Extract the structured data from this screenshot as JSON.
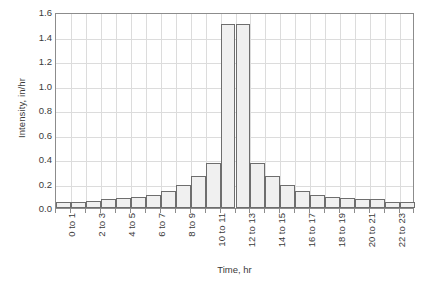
{
  "chart_data": {
    "type": "bar",
    "title": "",
    "xlabel": "Time, hr",
    "ylabel": "Intensity, in/hr",
    "ylim": [
      0.0,
      1.6
    ],
    "ytick_labels": [
      "1.6",
      "1.4",
      "1.2",
      "1.0",
      "0.8",
      "0.6",
      "0.4",
      "0.2",
      "0.0"
    ],
    "ytick_values": [
      1.6,
      1.4,
      1.2,
      1.0,
      0.8,
      0.6,
      0.4,
      0.2,
      0.0
    ],
    "ytick_step": 0.2,
    "grid": "both",
    "legend": "none",
    "categories": [
      "0 to 1",
      "1 to 2",
      "2 to 3",
      "3 to 4",
      "4 to 5",
      "5 to 6",
      "6 to 7",
      "7 to 8",
      "8 to 9",
      "9 to 10",
      "10 to 11",
      "11 to 12",
      "12 to 13",
      "13 to 14",
      "14 to 15",
      "15 to 16",
      "16 to 17",
      "17 to 18",
      "18 to 19",
      "19 to 20",
      "20 to 21",
      "21 to 22",
      "22 to 23",
      "23 to 24"
    ],
    "xtick_labels_shown": [
      "0 to 1",
      "2 to 3",
      "4 to 5",
      "6 to 7",
      "8 to 9",
      "10 to 11",
      "12 to 13",
      "14 to 15",
      "16 to 17",
      "18 to 19",
      "20 to 21",
      "22 to 23"
    ],
    "values": [
      0.05,
      0.05,
      0.06,
      0.07,
      0.08,
      0.09,
      0.11,
      0.14,
      0.19,
      0.26,
      0.37,
      1.5,
      1.5,
      0.37,
      0.26,
      0.19,
      0.14,
      0.11,
      0.09,
      0.08,
      0.07,
      0.07,
      0.05,
      0.05
    ],
    "bar_fill_color": "#f0f0f0",
    "bar_edge_color": "#6e6e6e",
    "grid_color": "#dcdcdc",
    "axis_color": "#8c8c8c",
    "text_color": "#3a3a3a"
  }
}
